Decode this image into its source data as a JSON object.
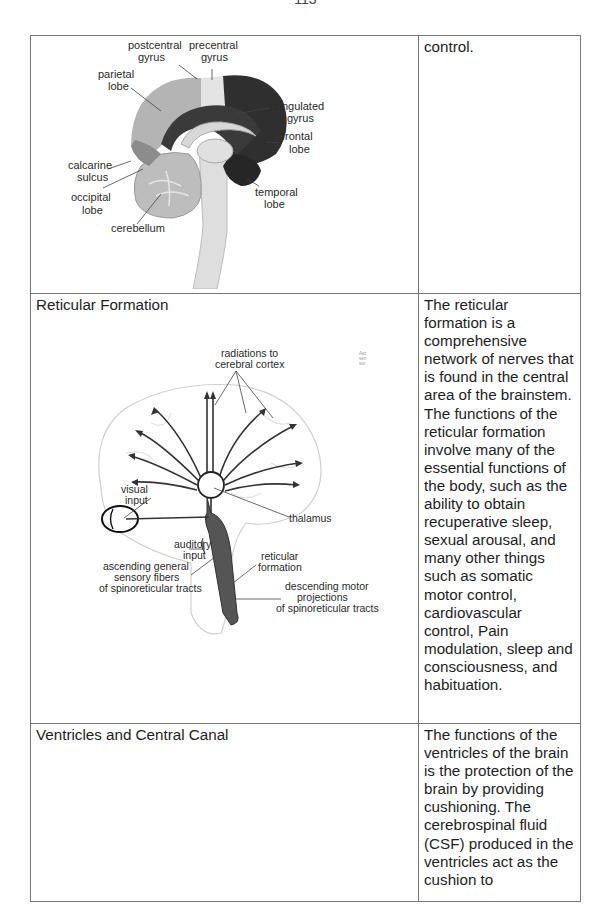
{
  "page": {
    "number": "113"
  },
  "table": {
    "rows": [
      {
        "title": "",
        "description": "control.",
        "diagram": {
          "name": "brain-sagittal-lobes",
          "labels": {
            "postcentral": [
              "postcentral",
              "gyrus"
            ],
            "precentral": [
              "precentral",
              "gyrus"
            ],
            "parietal": [
              "parietal",
              "lobe"
            ],
            "cingulated": [
              "cingulated",
              "gyrus"
            ],
            "frontal": [
              "frontal",
              "lobe"
            ],
            "calcarine": [
              "calcarine",
              "sulcus"
            ],
            "occipital": [
              "occipital",
              "lobe"
            ],
            "temporal": [
              "temporal",
              "lobe"
            ],
            "cerebellum": [
              "cerebellum"
            ]
          }
        }
      },
      {
        "title": "Reticular Formation",
        "description": "The reticular formation is a comprehensive network of nerves that is found in the central area of the brainstem. The functions of the reticular formation involve many of the essential functions of the body, such as the ability to obtain recuperative sleep, sexual arousal, and many other things such as somatic motor control, cardiovascular control, Pain modulation, sleep and consciousness, and habituation.",
        "diagram": {
          "name": "reticular-formation-pathways",
          "labels": {
            "radiations": [
              "radiations to",
              "cerebral cortex"
            ],
            "visual": [
              "visual",
              "input"
            ],
            "thalamus": [
              "thalamus"
            ],
            "auditory": [
              "auditory",
              "input"
            ],
            "ascending": [
              "ascending general",
              "sensory fibers",
              "of spinoreticular tracts"
            ],
            "reticular": [
              "reticular",
              "formation"
            ],
            "descending": [
              "descending motor",
              "projections",
              "of spinoreticular tracts"
            ],
            "fragment": [
              "Asc",
              "sen",
              "sor"
            ]
          }
        }
      },
      {
        "title": "Ventricles and Central Canal",
        "description": "The functions of the ventricles of the brain is the protection of the brain by providing cushioning. The cerebrospinal fluid (CSF) produced in the ventricles act as the cushion to"
      }
    ]
  }
}
